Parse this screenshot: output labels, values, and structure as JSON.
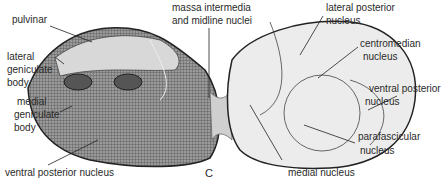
{
  "figure": {
    "panel_letter": "C",
    "labels": {
      "pulvinar": "pulvinar",
      "lateral_geniculate": [
        "lateral",
        "geniculate",
        "body"
      ],
      "medial_geniculate": [
        "medial",
        "geniculate",
        "body"
      ],
      "ventral_posterior_left": "ventral posterior nucleus",
      "massa_intermedia": [
        "massa intermedia",
        "and midline nuclei"
      ],
      "lateral_posterior": [
        "lateral posterior",
        "nucleus"
      ],
      "centromedian": [
        "centromedian",
        "nucleus"
      ],
      "ventral_posterior_right": [
        "ventral posterior",
        "nucleus"
      ],
      "parafascicular": [
        "parafascicular",
        "nucleus"
      ],
      "medial_nucleus": "medial nucleus"
    },
    "colors": {
      "left_fill": "#8a8a8a",
      "right_fill": "#ececec",
      "outline": "#333333"
    }
  }
}
